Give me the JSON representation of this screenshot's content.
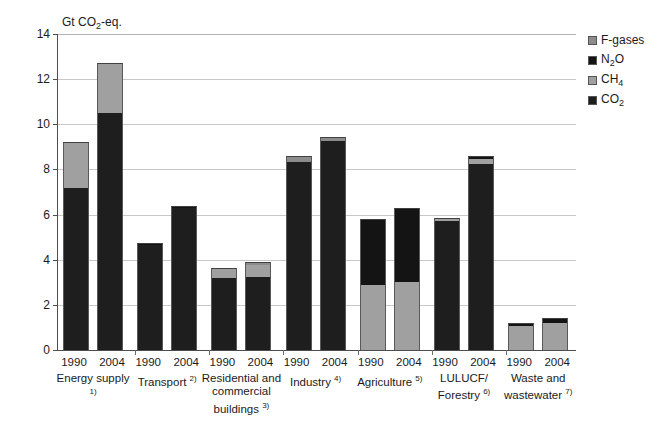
{
  "chart_data": {
    "type": "bar",
    "stacked": true,
    "title": "",
    "subtitle": "",
    "unit_caption": "Gt CO2-eq.",
    "xlabel": "",
    "ylabel": "Gt CO2-eq.",
    "ylim": [
      0,
      14
    ],
    "ytick_labels": [
      "0",
      "2",
      "4",
      "6",
      "8",
      "10",
      "12",
      "14"
    ],
    "ytick_values": [
      0,
      2,
      4,
      6,
      8,
      10,
      12,
      14
    ],
    "grid": "horizontal",
    "legend_position": "right",
    "series": [
      {
        "name": "F-gases",
        "color": "#8c8c8c"
      },
      {
        "name": "N2O",
        "color": "#141414"
      },
      {
        "name": "CH4",
        "color": "#a0a0a0"
      },
      {
        "name": "CO2",
        "color": "#1e1e1e"
      }
    ],
    "groups": [
      {
        "category": "Energy supply",
        "footnote": "1)",
        "bars": [
          {
            "year": "1990",
            "total": 9.2,
            "segments": [
              {
                "gas": "CO2",
                "value": 7.2
              },
              {
                "gas": "CH4",
                "value": 2.0
              }
            ]
          },
          {
            "year": "2004",
            "total": 12.7,
            "segments": [
              {
                "gas": "CO2",
                "value": 10.5
              },
              {
                "gas": "CH4",
                "value": 2.2
              }
            ]
          }
        ]
      },
      {
        "category": "Transport",
        "footnote": "2)",
        "bars": [
          {
            "year": "1990",
            "total": 4.75,
            "segments": [
              {
                "gas": "CO2",
                "value": 4.65
              },
              {
                "gas": "N2O",
                "value": 0.1
              }
            ]
          },
          {
            "year": "2004",
            "total": 6.4,
            "segments": [
              {
                "gas": "CO2",
                "value": 6.3
              },
              {
                "gas": "N2O",
                "value": 0.1
              }
            ]
          }
        ]
      },
      {
        "category": "Residential and commercial buildings",
        "footnote": "3)",
        "bars": [
          {
            "year": "1990",
            "total": 3.65,
            "segments": [
              {
                "gas": "CO2",
                "value": 3.2
              },
              {
                "gas": "CH4",
                "value": 0.45
              }
            ]
          },
          {
            "year": "2004",
            "total": 3.9,
            "segments": [
              {
                "gas": "CO2",
                "value": 3.25
              },
              {
                "gas": "CH4",
                "value": 0.5
              },
              {
                "gas": "F-gases",
                "value": 0.15
              }
            ]
          }
        ]
      },
      {
        "category": "Industry",
        "footnote": "4)",
        "bars": [
          {
            "year": "1990",
            "total": 8.6,
            "segments": [
              {
                "gas": "CO2",
                "value": 8.35
              },
              {
                "gas": "F-gases",
                "value": 0.25
              }
            ]
          },
          {
            "year": "2004",
            "total": 9.45,
            "segments": [
              {
                "gas": "CO2",
                "value": 9.25
              },
              {
                "gas": "F-gases",
                "value": 0.2
              }
            ]
          }
        ]
      },
      {
        "category": "Agriculture",
        "footnote": "5)",
        "bars": [
          {
            "year": "1990",
            "total": 5.8,
            "segments": [
              {
                "gas": "CH4",
                "value": 2.9
              },
              {
                "gas": "N2O",
                "value": 2.9
              }
            ]
          },
          {
            "year": "2004",
            "total": 6.3,
            "segments": [
              {
                "gas": "CH4",
                "value": 3.0
              },
              {
                "gas": "N2O",
                "value": 3.3
              }
            ]
          }
        ]
      },
      {
        "category": "LULUCF/ Forestry",
        "footnote": "6)",
        "bars": [
          {
            "year": "1990",
            "total": 5.85,
            "segments": [
              {
                "gas": "CO2",
                "value": 5.7
              },
              {
                "gas": "CH4",
                "value": 0.15
              }
            ]
          },
          {
            "year": "2004",
            "total": 8.6,
            "segments": [
              {
                "gas": "CO2",
                "value": 8.25
              },
              {
                "gas": "CH4",
                "value": 0.2
              },
              {
                "gas": "N2O",
                "value": 0.15
              }
            ]
          }
        ]
      },
      {
        "category": "Waste and wastewater",
        "footnote": "7)",
        "bars": [
          {
            "year": "1990",
            "total": 1.2,
            "segments": [
              {
                "gas": "CH4",
                "value": 1.05
              },
              {
                "gas": "N2O",
                "value": 0.15
              }
            ]
          },
          {
            "year": "2004",
            "total": 1.4,
            "segments": [
              {
                "gas": "CH4",
                "value": 1.2
              },
              {
                "gas": "N2O",
                "value": 0.2
              }
            ]
          }
        ]
      }
    ]
  },
  "legend": {
    "items": [
      {
        "label": "F-gases",
        "color": "#8c8c8c"
      },
      {
        "label": "N2O",
        "color": "#141414"
      },
      {
        "label": "CH4",
        "color": "#a0a0a0"
      },
      {
        "label": "CO2",
        "color": "#1e1e1e"
      }
    ]
  },
  "colors": {
    "f_gases": "#8c8c8c",
    "n2o": "#141414",
    "ch4": "#a0a0a0",
    "co2": "#1e1e1e",
    "axis": "#4d4d4d",
    "grid": "#c8c8c8",
    "background": "#ffffff"
  }
}
